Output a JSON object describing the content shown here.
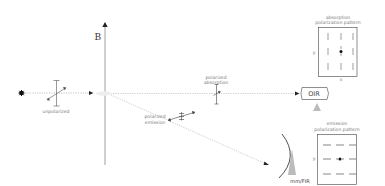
{
  "diagram": {
    "axis_label": "B",
    "source_label": "unpolarized",
    "absorption_polarizer_label": [
      "polarized",
      "absorption"
    ],
    "emission_polarizer_label": [
      "polarized",
      "emission"
    ],
    "oir_detector_label": "OIR",
    "mmfir_detector_label": "mm/FIR",
    "absorption_pattern": {
      "title": [
        "absorption",
        "polarization pattern"
      ],
      "y_axis_label": "y",
      "x_axis_label": "x",
      "line_orientation": "vertical"
    },
    "emission_pattern": {
      "title": [
        "emission",
        "polarization pattern"
      ],
      "y_axis_label": "y",
      "line_orientation": "horizontal"
    }
  },
  "colors": {
    "axis": "#777777",
    "beam": "#999999",
    "text": "#777777",
    "detector_fill": "#bbbbbb",
    "dark": "#111111"
  }
}
